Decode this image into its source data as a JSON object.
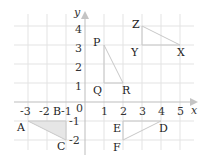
{
  "diagram": {
    "type": "coordinate-plane",
    "axes": {
      "x_label": "x",
      "y_label": "y",
      "x_ticks": [
        "-3",
        "-2",
        "-1",
        "1",
        "2",
        "3",
        "4",
        "5"
      ],
      "y_ticks": [
        "4",
        "3",
        "2",
        "1",
        "-1",
        "-2"
      ],
      "origin_label": "0",
      "x_range": [
        -3.5,
        5.8
      ],
      "y_range": [
        -2.6,
        4.8
      ]
    },
    "grid": {
      "on": true,
      "step": 1
    },
    "colors": {
      "grid": "#e3e3e3",
      "axis": "#bdbdbd",
      "shape_stroke": "#c8c8c8",
      "shaded_fill": "#e6e6e6"
    },
    "triangles": [
      {
        "name": "PQR",
        "shaded": false,
        "vertices": [
          {
            "label": "P",
            "x": 1,
            "y": 3
          },
          {
            "label": "Q",
            "x": 1,
            "y": 1
          },
          {
            "label": "R",
            "x": 2,
            "y": 1
          }
        ]
      },
      {
        "name": "ZYX",
        "shaded": false,
        "vertices": [
          {
            "label": "Z",
            "x": 3,
            "y": 4
          },
          {
            "label": "Y",
            "x": 3,
            "y": 3
          },
          {
            "label": "X",
            "x": 5,
            "y": 3
          }
        ]
      },
      {
        "name": "ABC",
        "shaded": true,
        "vertices": [
          {
            "label": "A",
            "x": -3,
            "y": -1
          },
          {
            "label": "B",
            "x": -1,
            "y": -1
          },
          {
            "label": "C",
            "x": -1,
            "y": -2
          }
        ]
      },
      {
        "name": "EDF",
        "shaded": false,
        "vertices": [
          {
            "label": "E",
            "x": 2,
            "y": -1
          },
          {
            "label": "D",
            "x": 4,
            "y": -1
          },
          {
            "label": "F",
            "x": 2,
            "y": -2
          }
        ]
      }
    ]
  }
}
